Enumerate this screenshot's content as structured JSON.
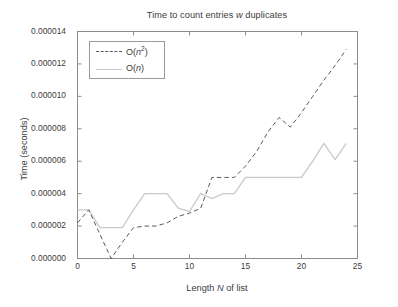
{
  "chart_data": {
    "type": "line",
    "title": "Time to count entries w duplicates",
    "title_parts": {
      "before": "Time to count entries ",
      "italic": "w",
      "after": " duplicates"
    },
    "xlabel": "Length N of list",
    "xlabel_parts": {
      "before": "Length ",
      "italic": "N",
      "after": " of list"
    },
    "ylabel": "Time (seconds)",
    "xlim": [
      0,
      25
    ],
    "ylim": [
      0.0,
      1.4e-05
    ],
    "grid": false,
    "legend_position": "upper left",
    "xticks": [
      "0",
      "5",
      "10",
      "15",
      "20",
      "25"
    ],
    "xtick_values": [
      0,
      5,
      10,
      15,
      20,
      25
    ],
    "yticks": [
      "0.000000",
      "0.000002",
      "0.000004",
      "0.000006",
      "0.000008",
      "0.000010",
      "0.000012",
      "0.000014"
    ],
    "ytick_values": [
      0.0,
      2e-06,
      4e-06,
      6e-06,
      8e-06,
      1e-05,
      1.2e-05,
      1.4e-05
    ],
    "x": [
      0,
      1,
      2,
      3,
      4,
      5,
      6,
      7,
      8,
      9,
      10,
      11,
      12,
      13,
      14,
      15,
      16,
      17,
      18,
      19,
      20,
      21,
      22,
      23,
      24
    ],
    "series": [
      {
        "name": "O(n^2)",
        "label_parts": {
          "before": "O(",
          "italic": "n",
          "sup": "2",
          "after": ")"
        },
        "style": "dashed",
        "color": "#5a5a5a",
        "values": [
          2.2e-06,
          3e-06,
          1.5e-06,
          0.0,
          1e-06,
          1.9e-06,
          2e-06,
          2e-06,
          2.2e-06,
          2.6e-06,
          2.8e-06,
          3.1e-06,
          5e-06,
          5e-06,
          5e-06,
          5.7e-06,
          6.6e-06,
          7.8e-06,
          8.7e-06,
          8.1e-06,
          9e-06,
          1e-05,
          1.1e-05,
          1.19e-05,
          1.29e-05
        ]
      },
      {
        "name": "O(n)",
        "label_parts": {
          "before": "O(",
          "italic": "n",
          "sup": "",
          "after": ")"
        },
        "style": "solid",
        "color": "#c9c9c9",
        "values": [
          3e-06,
          3e-06,
          1.9e-06,
          1.9e-06,
          1.9e-06,
          3e-06,
          4e-06,
          4e-06,
          4e-06,
          3.1e-06,
          2.9e-06,
          4e-06,
          3.7e-06,
          4e-06,
          4e-06,
          5e-06,
          5e-06,
          5e-06,
          5e-06,
          5e-06,
          5e-06,
          6e-06,
          7.1e-06,
          6.1e-06,
          7.1e-06
        ]
      }
    ]
  },
  "axes": {
    "frame_color": "#8d8d8d"
  }
}
